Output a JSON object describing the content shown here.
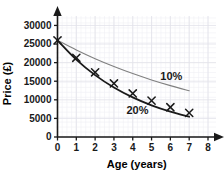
{
  "chart_data": {
    "type": "line",
    "title": "",
    "xlabel": "Age (years)",
    "ylabel": "Price (£)",
    "xlim": [
      0,
      8
    ],
    "ylim": [
      0,
      32000
    ],
    "x_ticks": [
      0,
      1,
      2,
      3,
      4,
      5,
      6,
      7,
      8
    ],
    "x_tick_labels": [
      "0",
      "1",
      "2",
      "3",
      "4",
      "5",
      "6",
      "7",
      "8"
    ],
    "y_ticks": [
      0,
      5000,
      10000,
      15000,
      20000,
      25000,
      30000
    ],
    "y_tick_labels": [
      "0",
      "5000",
      "10000",
      "15000",
      "20000",
      "25000",
      "30000"
    ],
    "grid": true,
    "legend_position": "inline-annotation",
    "series": [
      {
        "name": "10%",
        "label": "10%",
        "color": "#808080",
        "linewidth": 1.1,
        "marker": "none",
        "x": [
          0,
          1,
          2,
          3,
          4,
          5,
          6,
          7
        ],
        "values": [
          26000,
          23400,
          21060,
          18954,
          17059,
          15353,
          13817,
          12436
        ]
      },
      {
        "name": "20%",
        "label": "20%",
        "color": "#1a1a1a",
        "linewidth": 1.8,
        "marker": "x",
        "x": [
          0,
          1,
          2,
          3,
          4,
          5,
          6,
          7
        ],
        "values": [
          26000,
          20800,
          16640,
          13312,
          10650,
          8520,
          6816,
          5453
        ]
      }
    ],
    "data_markers": {
      "symbol": "x",
      "color": "#1a1a1a",
      "x": [
        0,
        1,
        2,
        3,
        4,
        5,
        6,
        7
      ],
      "values": [
        26000,
        21300,
        17400,
        14400,
        11700,
        9800,
        8000,
        6500
      ]
    },
    "annotations": [
      {
        "text": "10%",
        "x": 6.05,
        "y": 15300
      },
      {
        "text": "20%",
        "x": 4.25,
        "y": 6100
      }
    ]
  },
  "axes": {
    "y_axis_arrow": "arrow-up",
    "x_axis_arrow": "arrow-right",
    "axis_color": "#1a1a1a"
  },
  "colors": {
    "background": "#ffffff",
    "grid_major": "#e2e2ea",
    "grid_minor": "#f0f0f5",
    "axis": "#1a1a1a",
    "series_10": "#808080",
    "series_20": "#1a1a1a"
  },
  "cropped_header": {
    "text": ""
  }
}
